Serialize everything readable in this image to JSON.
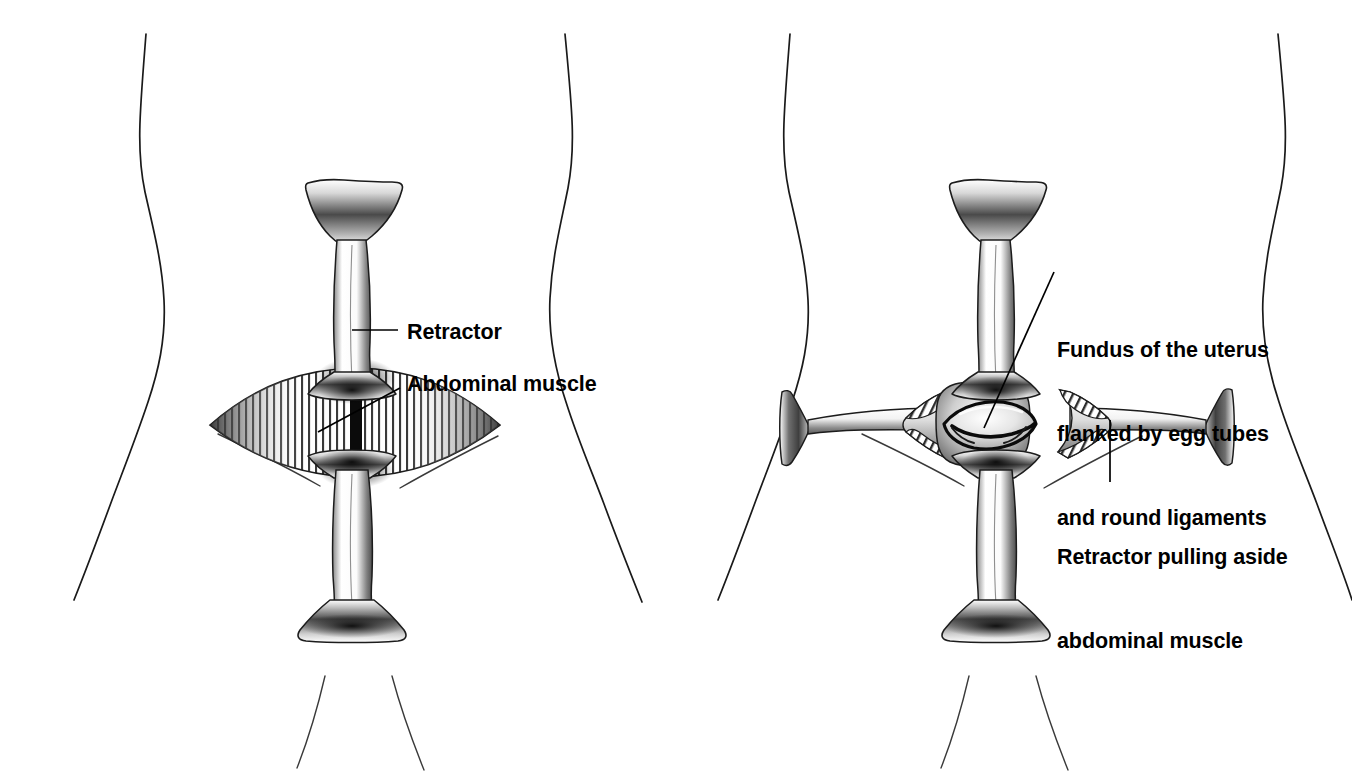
{
  "illustration": {
    "title": "Caesarean section abdominal retraction",
    "background_color": "#ffffff",
    "ink_color": "#000000",
    "panel_count": 2
  },
  "panels": [
    {
      "id": "left-panel",
      "name": "incision-with-retractor",
      "description": "Lower abdomen with vertical retractor and exposed abdominal muscle",
      "labels": [
        "retractor",
        "abdominal_muscle"
      ]
    },
    {
      "id": "right-panel",
      "name": "retracted-uterus-exposed",
      "description": "Lower abdomen with cross retractors exposing fundus of the uterus",
      "labels": [
        "fundus",
        "retractor_pulling"
      ]
    }
  ],
  "labels": {
    "retractor": "Retractor",
    "abdominal_muscle": "Abdominal muscle",
    "fundus_line1": "Fundus of the uterus",
    "fundus_line2": "flanked by egg tubes",
    "fundus_line3": "and round ligaments",
    "retractor_pull_line1": "Retractor pulling aside",
    "retractor_pull_line2": "abdominal muscle"
  }
}
